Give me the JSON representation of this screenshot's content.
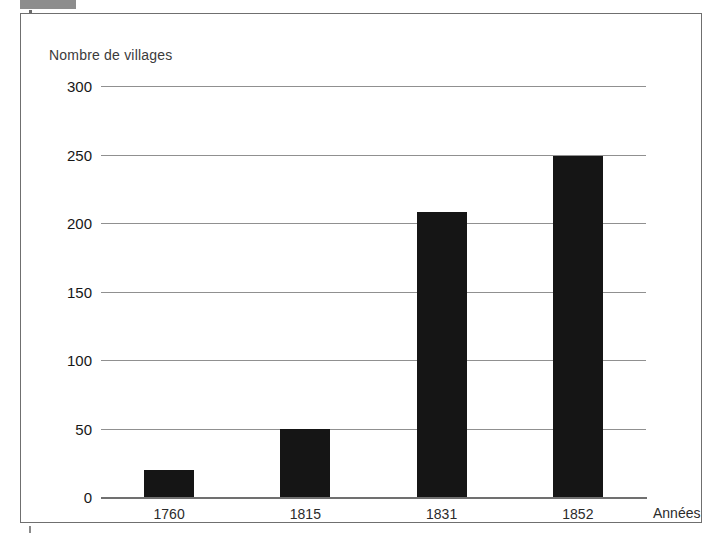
{
  "figure": {
    "y_axis_title": "Nombre de villages",
    "x_axis_title": "Années"
  },
  "chart_data": {
    "type": "bar",
    "title": "",
    "subtitle": "",
    "xlabel": "Années",
    "ylabel": "Nombre de villages",
    "categories": [
      "1760",
      "1815",
      "1831",
      "1852"
    ],
    "values": [
      20,
      50,
      208,
      249
    ],
    "series": [
      {
        "name": "Nombre de villages",
        "values": [
          20,
          50,
          208,
          249
        ],
        "color": "#151515"
      }
    ],
    "ylim": [
      0,
      300
    ],
    "yticks": [
      0,
      50,
      100,
      150,
      200,
      250,
      300
    ],
    "ytick_labels": [
      "0",
      "50",
      "100",
      "150",
      "200",
      "250",
      "300"
    ],
    "grid": true,
    "grid_axis": "y",
    "legend": false,
    "legend_position": "none",
    "bar_color": "#151515",
    "grid_color": "#909090",
    "frame_color": "#6f6f6f",
    "background": "#ffffff"
  }
}
